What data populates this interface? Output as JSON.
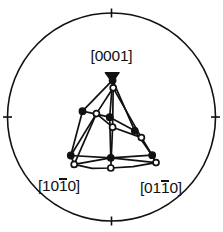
{
  "figure": {
    "type": "stereographic-projection",
    "background_color": "#ffffff",
    "line_color": "#111111",
    "marker_fill_color": "#111111",
    "marker_open_color": "#ffffff"
  },
  "labels": {
    "top": {
      "open": "[",
      "d1": "0",
      "d2": "0",
      "d3": "0",
      "d4": "1",
      "close": "]"
    },
    "bottom_left": {
      "open": "[",
      "d1": "1",
      "d2": "0",
      "d3": "1",
      "d4": "0",
      "close": "]"
    },
    "bottom_right": {
      "open": "[",
      "d1": "0",
      "d2": "1",
      "d3": "1",
      "d4": "0",
      "close": "]"
    }
  },
  "chart_data": {
    "type": "scatter",
    "title": "",
    "subtitle": "",
    "xlabel": "",
    "ylabel": "",
    "xlim": [
      -1,
      1
    ],
    "ylim": [
      -1,
      1
    ],
    "grid": false,
    "legend": null,
    "projection": "stereographic",
    "boundary": {
      "shape": "circle",
      "cx": 111.5,
      "cy": 117,
      "r": 104,
      "stroke_width": 1.6
    },
    "ticks": {
      "positions_deg": [
        0,
        90,
        180,
        270
      ],
      "length": 9,
      "stroke_width": 1.6,
      "labels": []
    },
    "corner_labels": [
      {
        "name": "c-axis",
        "text": "[0001]",
        "x": 111.5,
        "y": 56,
        "anchor": "middle"
      },
      {
        "name": "a-axis",
        "text": "[10-10]",
        "x": 66,
        "y": 188,
        "anchor": "middle"
      },
      {
        "name": "m-axis",
        "text": "[01-10]",
        "x": 163,
        "y": 190,
        "anchor": "middle"
      }
    ],
    "series": [
      {
        "name": "filled-markers",
        "marker": "filled-circle",
        "size": 5.4,
        "points": [
          [
            112.6,
            80.2
          ],
          [
            82.5,
            111.2
          ],
          [
            109.7,
            117.2
          ],
          [
            134.8,
            130.8
          ],
          [
            70.8,
            155.5
          ],
          [
            110.8,
            157.8
          ],
          [
            152.2,
            155.2
          ]
        ]
      },
      {
        "name": "open-markers",
        "marker": "open-circle",
        "size": 5.2,
        "points": [
          [
            113.2,
            87.8
          ],
          [
            96.4,
            113.6
          ],
          [
            112.6,
            127.2
          ],
          [
            141.4,
            137.6
          ],
          [
            74.2,
            164.4
          ],
          [
            110.8,
            168.0
          ],
          [
            156.0,
            162.6
          ]
        ]
      },
      {
        "name": "apex-triangle",
        "marker": "filled-triangle-down",
        "size": 7.0,
        "points": [
          [
            112.2,
            77.0
          ]
        ]
      }
    ],
    "polylines": [
      {
        "name": "outer-left-edge-filled",
        "style": "solid",
        "points": [
          [
            112.6,
            80.2
          ],
          [
            82.5,
            111.2
          ],
          [
            70.8,
            155.5
          ]
        ]
      },
      {
        "name": "outer-right-edge-filled",
        "style": "solid",
        "points": [
          [
            112.6,
            80.2
          ],
          [
            134.8,
            130.8
          ],
          [
            152.2,
            155.2
          ]
        ]
      },
      {
        "name": "inner-left-edge-open",
        "style": "solid",
        "points": [
          [
            113.2,
            87.8
          ],
          [
            96.4,
            113.6
          ],
          [
            74.2,
            164.4
          ]
        ]
      },
      {
        "name": "inner-right-edge-open",
        "style": "solid",
        "points": [
          [
            113.2,
            87.8
          ],
          [
            141.4,
            137.6
          ],
          [
            156.0,
            162.6
          ]
        ]
      },
      {
        "name": "center-spine-filled",
        "style": "solid",
        "points": [
          [
            112.6,
            80.2
          ],
          [
            109.7,
            117.2
          ],
          [
            110.8,
            157.8
          ]
        ]
      },
      {
        "name": "center-spine-open",
        "style": "solid",
        "points": [
          [
            113.2,
            87.8
          ],
          [
            112.6,
            127.2
          ],
          [
            110.8,
            168.0
          ]
        ]
      },
      {
        "name": "mid-cross-filled",
        "style": "solid",
        "points": [
          [
            82.5,
            111.2
          ],
          [
            109.7,
            117.2
          ],
          [
            134.8,
            130.8
          ]
        ]
      },
      {
        "name": "mid-cross-open",
        "style": "solid",
        "points": [
          [
            96.4,
            113.6
          ],
          [
            112.6,
            127.2
          ],
          [
            141.4,
            137.6
          ]
        ]
      },
      {
        "name": "base-chord-filled",
        "style": "solid",
        "points": [
          [
            70.8,
            155.5
          ],
          [
            110.8,
            157.8
          ],
          [
            152.2,
            155.2
          ]
        ]
      },
      {
        "name": "base-arc-open",
        "style": "solid",
        "points": [
          [
            74.2,
            164.4
          ],
          [
            92.0,
            168.4
          ],
          [
            110.8,
            168.0
          ],
          [
            133.0,
            166.6
          ],
          [
            156.0,
            162.6
          ]
        ]
      },
      {
        "name": "base-left-connector",
        "style": "solid",
        "points": [
          [
            70.8,
            155.5
          ],
          [
            74.2,
            164.4
          ]
        ]
      },
      {
        "name": "base-right-connector",
        "style": "solid",
        "points": [
          [
            152.2,
            155.2
          ],
          [
            156.0,
            162.6
          ]
        ]
      },
      {
        "name": "base-left-open-chord",
        "style": "solid",
        "points": [
          [
            74.2,
            164.4
          ],
          [
            110.8,
            157.8
          ]
        ]
      },
      {
        "name": "base-right-open-chord",
        "style": "solid",
        "points": [
          [
            110.8,
            157.8
          ],
          [
            156.0,
            162.6
          ]
        ]
      },
      {
        "name": "left-open-to-base-filled",
        "style": "solid",
        "points": [
          [
            96.4,
            113.6
          ],
          [
            70.8,
            155.5
          ]
        ]
      },
      {
        "name": "right-open-to-base-filled",
        "style": "solid",
        "points": [
          [
            141.4,
            137.6
          ],
          [
            152.2,
            155.2
          ]
        ]
      }
    ]
  }
}
